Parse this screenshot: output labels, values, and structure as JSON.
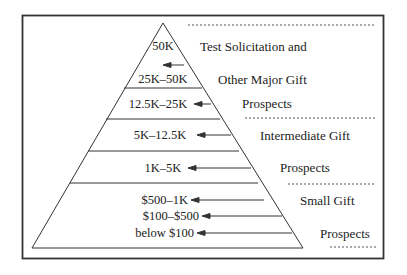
{
  "diagram": {
    "type": "pyramid",
    "tiers": [
      {
        "label": "50K"
      },
      {
        "label": "25K–50K"
      },
      {
        "label": "12.5K–25K"
      },
      {
        "label": "5K–12.5K"
      },
      {
        "label": "1K–5K"
      },
      {
        "label": "$500–1K"
      },
      {
        "label": "$100–$500"
      },
      {
        "label": "below $100"
      }
    ],
    "groups": [
      {
        "lines": [
          "Test Solicitation and",
          "Other Major Gift",
          "Prospects"
        ]
      },
      {
        "lines": [
          "Intermediate Gift",
          "Prospects"
        ]
      },
      {
        "lines": [
          "Small Gift",
          "Prospects"
        ]
      }
    ],
    "colors": {
      "line": "#333333",
      "text": "#222222",
      "dash": "#555555"
    }
  }
}
